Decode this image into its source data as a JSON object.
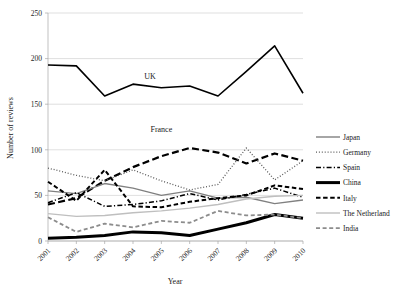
{
  "chart_data": {
    "type": "line",
    "title": "",
    "xlabel": "Year",
    "ylabel": "Number of reviews",
    "categories": [
      "2001",
      "2002",
      "2003",
      "2004",
      "2005",
      "2006",
      "2007",
      "2008",
      "2009",
      "2010"
    ],
    "x": [
      2001,
      2002,
      2003,
      2004,
      2005,
      2006,
      2007,
      2008,
      2009,
      2010
    ],
    "ylim": [
      0,
      250
    ],
    "yticks": [
      0,
      50,
      100,
      150,
      200,
      250
    ],
    "grid": true,
    "legend_position": "right",
    "annotations": [
      {
        "text": "UK",
        "x": 2004.6,
        "y": 178
      },
      {
        "text": "France",
        "x": 2005.0,
        "y": 120
      }
    ],
    "series": [
      {
        "name": "UK",
        "style": "solid",
        "color": "#000000",
        "width": 1.6,
        "in_legend": false,
        "values": [
          193,
          192,
          159,
          172,
          168,
          170,
          159,
          186,
          214,
          162
        ]
      },
      {
        "name": "France",
        "style": "dashed-long",
        "color": "#000000",
        "width": 2.2,
        "in_legend": false,
        "values": [
          40,
          47,
          66,
          81,
          93,
          102,
          97,
          85,
          96,
          88
        ]
      },
      {
        "name": "Japan",
        "style": "solid",
        "color": "#808080",
        "width": 1.4,
        "in_legend": true,
        "values": [
          55,
          52,
          63,
          58,
          50,
          55,
          47,
          48,
          41,
          45
        ]
      },
      {
        "name": "Germany",
        "style": "dotted",
        "color": "#595959",
        "width": 1.3,
        "in_legend": true,
        "values": [
          80,
          72,
          66,
          78,
          66,
          56,
          62,
          102,
          67,
          88
        ]
      },
      {
        "name": "Spain",
        "style": "dash-dot",
        "color": "#000000",
        "width": 1.5,
        "in_legend": true,
        "values": [
          42,
          53,
          38,
          40,
          44,
          52,
          45,
          51,
          58,
          48
        ]
      },
      {
        "name": "China",
        "style": "solid",
        "color": "#000000",
        "width": 3.0,
        "in_legend": true,
        "values": [
          3,
          4,
          6,
          10,
          9,
          6,
          13,
          20,
          29,
          25
        ]
      },
      {
        "name": "Italy",
        "style": "dashed",
        "color": "#000000",
        "width": 2.0,
        "in_legend": true,
        "values": [
          65,
          44,
          78,
          38,
          37,
          43,
          47,
          50,
          61,
          57
        ]
      },
      {
        "name": "The Netherland",
        "style": "solid",
        "color": "#bfbfbf",
        "width": 1.4,
        "in_legend": true,
        "values": [
          30,
          27,
          28,
          31,
          33,
          36,
          40,
          46,
          49,
          50
        ]
      },
      {
        "name": "India",
        "style": "dashed-gray",
        "color": "#8c8c8c",
        "width": 1.8,
        "in_legend": true,
        "values": [
          26,
          10,
          19,
          15,
          22,
          20,
          33,
          28,
          29,
          25
        ]
      }
    ]
  },
  "legend": {
    "items": [
      {
        "label": "Japan"
      },
      {
        "label": "Germany"
      },
      {
        "label": "Spain"
      },
      {
        "label": "China"
      },
      {
        "label": "Italy"
      },
      {
        "label": "The Netherland"
      },
      {
        "label": "India"
      }
    ]
  }
}
